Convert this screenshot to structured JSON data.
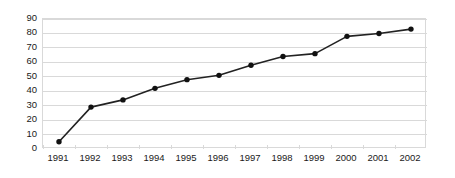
{
  "chart_data": {
    "type": "line",
    "title": "",
    "subtitle": "",
    "xlabel": "",
    "ylabel": "",
    "categories": [
      "1991",
      "1992",
      "1993",
      "1994",
      "1995",
      "1996",
      "1997",
      "1998",
      "1999",
      "2000",
      "2001",
      "2002"
    ],
    "values": [
      5,
      29,
      34,
      42,
      48,
      51,
      58,
      64,
      66,
      78,
      80,
      83
    ],
    "series": [
      {
        "name": "",
        "values": [
          5,
          29,
          34,
          42,
          48,
          51,
          58,
          64,
          66,
          78,
          80,
          83
        ]
      }
    ],
    "ylim": [
      0,
      90
    ],
    "y_ticks": [
      0,
      10,
      20,
      30,
      40,
      50,
      60,
      70,
      80,
      90
    ],
    "y_tick_labels": [
      "0",
      "10",
      "20",
      "30",
      "40",
      "50",
      "60",
      "70",
      "80",
      "90"
    ],
    "x_tick_labels": [
      "1991",
      "1992",
      "1993",
      "1994",
      "1995",
      "1996",
      "1997",
      "1998",
      "1999",
      "2000",
      "2001",
      "2002"
    ],
    "grid": "horizontal",
    "legend": "none",
    "marker": "filled-circle",
    "colors": {
      "line": "#222222",
      "marker": "#111111",
      "gridline": "#d9d9d9",
      "plot_border": "#d9d9d9",
      "text": "#1a1a1a",
      "background": "#ffffff"
    }
  }
}
